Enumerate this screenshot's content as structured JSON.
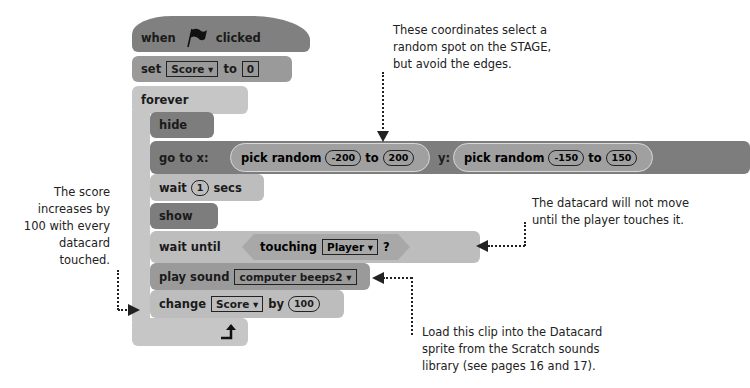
{
  "script": {
    "hat": {
      "when": "when",
      "clicked": "clicked",
      "icon": "green-flag-icon"
    },
    "set": {
      "label": "set",
      "variable": "Score ▾",
      "to": "to",
      "value": "0"
    },
    "forever": {
      "label": "forever"
    },
    "hide": {
      "label": "hide"
    },
    "goto": {
      "label": "go to x:",
      "y_label": "y:",
      "x_random": {
        "label": "pick random",
        "from": "-200",
        "to_label": "to",
        "to": "200"
      },
      "y_random": {
        "label": "pick random",
        "from": "-150",
        "to_label": "to",
        "to": "150"
      }
    },
    "wait": {
      "label": "wait",
      "value": "1",
      "unit": "secs"
    },
    "show": {
      "label": "show"
    },
    "wait_until": {
      "label": "wait until",
      "touching": "touching",
      "target": "Player ▾",
      "q": "?"
    },
    "play_sound": {
      "label": "play sound",
      "sound": "computer beeps2 ▾"
    },
    "change": {
      "label": "change",
      "variable": "Score ▾",
      "by": "by",
      "value": "100"
    },
    "loop_icon": "loop-arrow-icon"
  },
  "annotations": {
    "coords": [
      "These coordinates select a",
      "random spot on the STAGE,",
      "but avoid the edges."
    ],
    "score": [
      "The score",
      "increases by",
      "100 with every",
      "datacard",
      "touched."
    ],
    "datacard": [
      "The datacard will not move",
      "until the player touches it."
    ],
    "sound": [
      "Load this clip into the Datacard",
      "sprite from the Scratch sounds",
      "library (see pages 16 and 17)."
    ]
  },
  "colors": {
    "events": "#808080",
    "data": "#9a9a9a",
    "control": "#bdbdbd",
    "looks": "#7d7d7d",
    "sensing": "#a8a8a8"
  }
}
